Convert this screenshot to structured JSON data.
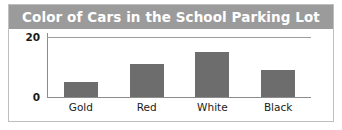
{
  "chart_data": {
    "type": "bar",
    "title": "Color of Cars in the School Parking Lot",
    "categories": [
      "Gold",
      "Red",
      "White",
      "Black"
    ],
    "values": [
      5,
      11,
      15,
      9
    ],
    "xlabel": "",
    "ylabel": "",
    "ylim": [
      0,
      20
    ],
    "yticks": [
      0,
      20
    ],
    "ytick_labels": [
      "0",
      "20"
    ],
    "grid": true,
    "legend": false,
    "bar_color": "#6d6d6d",
    "title_background": "#9b9b9b",
    "title_color": "#ffffff",
    "axis_color": "#8c8c8c",
    "gridline_color": "#9e9e9e",
    "panel_border_color": "#bfbfbf",
    "background": "#ffffff"
  }
}
